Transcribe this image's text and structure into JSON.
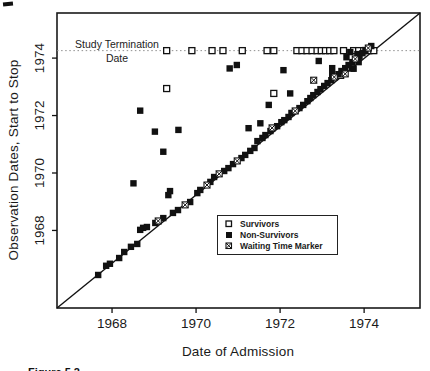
{
  "figure": {
    "y_axis_title": "Observation Dates, Start to Stop",
    "x_axis_title": "Date of Admission",
    "termination_label_line1": "Study Termination",
    "termination_label_line2": "Date",
    "caption": "Figure 5.2"
  },
  "chart_data": {
    "type": "scatter",
    "title": "",
    "xlabel": "Date of Admission",
    "ylabel": "Observation Dates, Start to Stop",
    "xlim": [
      1966.69,
      1975.33
    ],
    "ylim": [
      1965.3,
      1975.57
    ],
    "x_ticks": [
      1968,
      1970,
      1972,
      1974
    ],
    "y_ticks": [
      1968,
      1970,
      1972,
      1974
    ],
    "grid": false,
    "legend_position": "inside lower right",
    "termination_line_y": 1974.26,
    "reference_line": "diagonal from lower-left to upper-right corner (admission date = observation start)",
    "series": [
      {
        "name": "Survivors",
        "marker": "open-square",
        "points": [
          [
            1969.3,
            1974.26
          ],
          [
            1969.9,
            1974.26
          ],
          [
            1970.38,
            1974.26
          ],
          [
            1970.64,
            1974.26
          ],
          [
            1971.1,
            1974.26
          ],
          [
            1971.69,
            1974.26
          ],
          [
            1971.85,
            1974.26
          ],
          [
            1972.4,
            1974.26
          ],
          [
            1972.52,
            1974.26
          ],
          [
            1972.64,
            1974.26
          ],
          [
            1972.76,
            1974.26
          ],
          [
            1972.88,
            1974.26
          ],
          [
            1972.98,
            1974.26
          ],
          [
            1973.08,
            1974.26
          ],
          [
            1973.18,
            1974.26
          ],
          [
            1973.28,
            1974.26
          ],
          [
            1973.51,
            1974.26
          ],
          [
            1973.75,
            1974.26
          ],
          [
            1973.87,
            1974.26
          ],
          [
            1973.99,
            1974.26
          ],
          [
            1974.11,
            1974.26
          ],
          [
            1974.23,
            1974.26
          ],
          [
            1969.3,
            1972.94
          ],
          [
            1971.85,
            1972.77
          ],
          [
            1973.44,
            1973.4
          ]
        ]
      },
      {
        "name": "Non-Survivors",
        "marker": "filled-square",
        "points": [
          [
            1968.51,
            1969.64
          ],
          [
            1968.67,
            1972.17
          ],
          [
            1969.02,
            1971.44
          ],
          [
            1969.22,
            1970.74
          ],
          [
            1969.34,
            1969.23
          ],
          [
            1969.38,
            1969.37
          ],
          [
            1969.58,
            1971.5
          ],
          [
            1970.8,
            1973.64
          ],
          [
            1970.97,
            1973.76
          ],
          [
            1971.25,
            1971.56
          ],
          [
            1971.53,
            1971.73
          ],
          [
            1971.73,
            1972.37
          ],
          [
            1972.08,
            1973.58
          ],
          [
            1972.24,
            1972.77
          ],
          [
            1972.92,
            1973.9
          ],
          [
            1973.24,
            1973.65
          ],
          [
            1973.24,
            1973.44
          ],
          [
            1973.58,
            1974.03
          ],
          [
            1973.67,
            1974.21
          ],
          [
            1973.71,
            1973.64
          ],
          [
            1973.75,
            1973.63
          ],
          [
            1973.84,
            1974.14
          ],
          [
            1973.87,
            1973.86
          ],
          [
            1967.67,
            1966.45
          ],
          [
            1967.86,
            1966.77
          ],
          [
            1967.95,
            1966.84
          ],
          [
            1968.17,
            1967.04
          ],
          [
            1968.29,
            1967.25
          ],
          [
            1968.45,
            1967.43
          ],
          [
            1968.6,
            1967.53
          ],
          [
            1968.67,
            1968.02
          ],
          [
            1968.74,
            1968.09
          ],
          [
            1968.83,
            1968.12
          ],
          [
            1969.03,
            1968.26
          ],
          [
            1969.22,
            1968.43
          ],
          [
            1969.45,
            1968.61
          ],
          [
            1969.57,
            1968.71
          ],
          [
            1969.86,
            1968.99
          ],
          [
            1970.03,
            1969.3
          ],
          [
            1970.1,
            1969.41
          ],
          [
            1970.34,
            1969.69
          ],
          [
            1970.43,
            1969.86
          ],
          [
            1970.67,
            1970.07
          ],
          [
            1970.77,
            1970.17
          ],
          [
            1970.88,
            1970.31
          ],
          [
            1971.08,
            1970.52
          ],
          [
            1971.17,
            1970.63
          ],
          [
            1971.29,
            1970.77
          ],
          [
            1971.39,
            1970.87
          ],
          [
            1971.46,
            1971.11
          ],
          [
            1971.58,
            1971.22
          ],
          [
            1971.65,
            1971.32
          ],
          [
            1971.77,
            1971.46
          ],
          [
            1971.93,
            1971.63
          ],
          [
            1972.03,
            1971.77
          ],
          [
            1972.1,
            1971.84
          ],
          [
            1972.2,
            1971.95
          ],
          [
            1972.27,
            1972.09
          ],
          [
            1972.46,
            1972.26
          ],
          [
            1972.55,
            1972.37
          ],
          [
            1972.65,
            1972.5
          ],
          [
            1972.72,
            1972.61
          ],
          [
            1972.79,
            1972.71
          ],
          [
            1972.89,
            1972.82
          ],
          [
            1972.96,
            1972.92
          ],
          [
            1973.05,
            1973.03
          ],
          [
            1973.13,
            1973.13
          ],
          [
            1973.22,
            1973.23
          ],
          [
            1973.39,
            1973.44
          ],
          [
            1973.46,
            1973.55
          ],
          [
            1973.55,
            1973.65
          ],
          [
            1973.63,
            1973.76
          ],
          [
            1973.72,
            1973.86
          ],
          [
            1973.89,
            1974.07
          ],
          [
            1973.96,
            1974.17
          ],
          [
            1974.03,
            1974.28
          ],
          [
            1974.17,
            1974.42
          ]
        ]
      },
      {
        "name": "Waiting Time Marker",
        "marker": "crossed-square",
        "points": [
          [
            1969.1,
            1968.33
          ],
          [
            1969.74,
            1968.89
          ],
          [
            1970.26,
            1969.58
          ],
          [
            1970.55,
            1969.97
          ],
          [
            1970.98,
            1970.42
          ],
          [
            1971.81,
            1971.57
          ],
          [
            1972.36,
            1972.16
          ],
          [
            1972.8,
            1973.23
          ],
          [
            1973.29,
            1973.34
          ],
          [
            1973.55,
            1973.45
          ],
          [
            1973.79,
            1973.97
          ],
          [
            1974.1,
            1974.35
          ]
        ]
      }
    ]
  }
}
